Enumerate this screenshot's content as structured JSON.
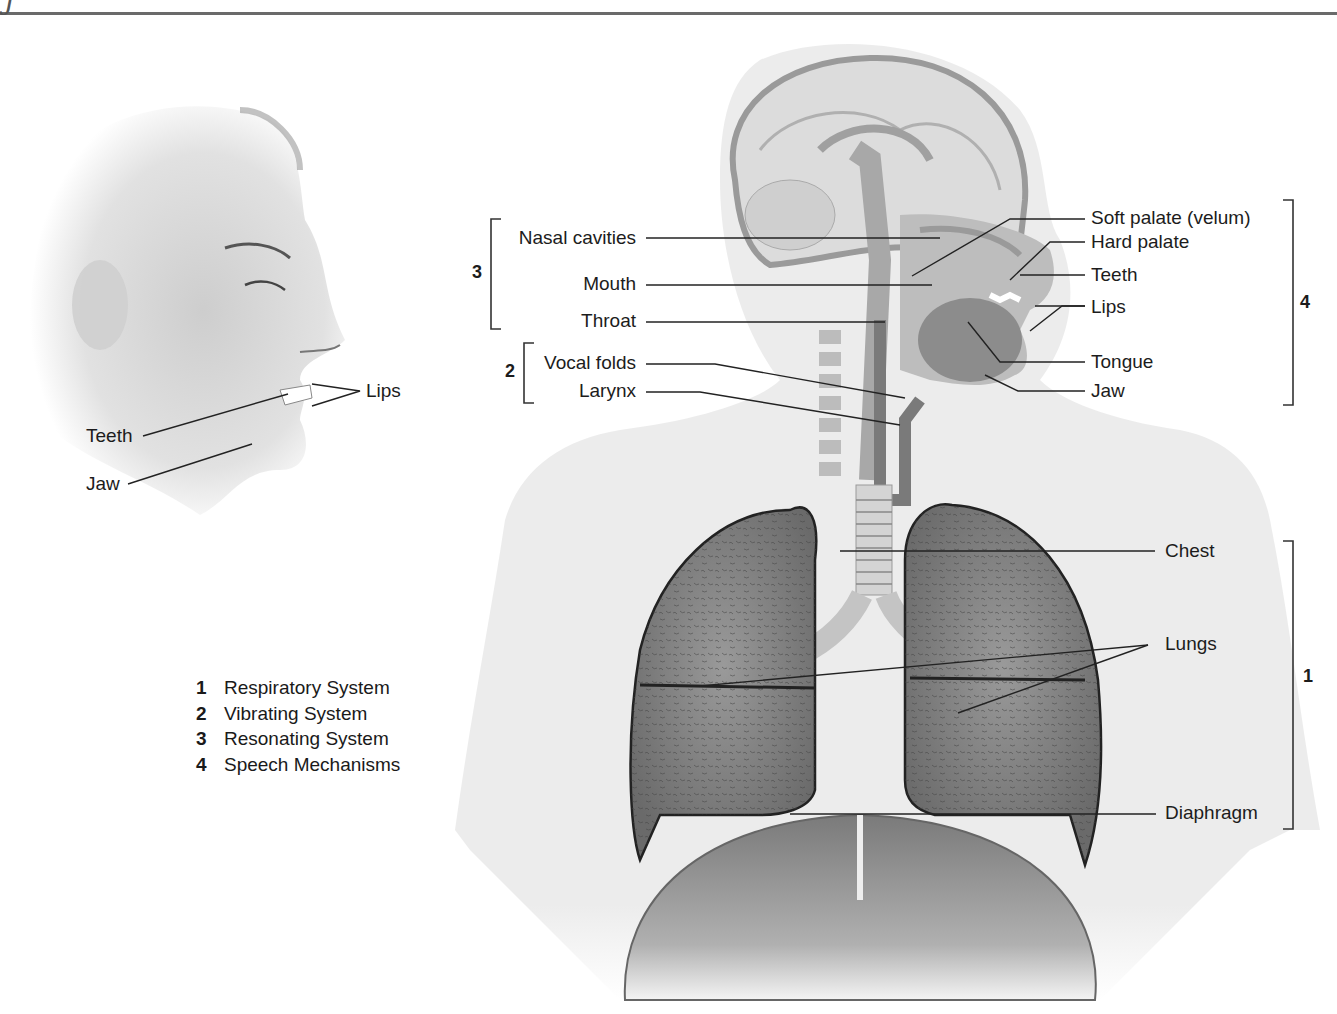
{
  "figure": {
    "corner_glyph": "J",
    "face_labels": {
      "lips": "Lips",
      "teeth": "Teeth",
      "jaw": "Jaw"
    },
    "left_group_labels": {
      "nasal_cavities": "Nasal cavities",
      "mouth": "Mouth",
      "throat": "Throat",
      "vocal_folds": "Vocal folds",
      "larynx": "Larynx"
    },
    "right_group_labels": {
      "soft_palate": "Soft palate (velum)",
      "hard_palate": "Hard palate",
      "teeth": "Teeth",
      "lips": "Lips",
      "tongue": "Tongue",
      "jaw": "Jaw"
    },
    "torso_labels": {
      "chest": "Chest",
      "lungs": "Lungs",
      "diaphragm": "Diaphragm"
    },
    "bracket_numbers": {
      "resonating": "3",
      "vibrating": "2",
      "speech": "4",
      "respiratory": "1"
    },
    "legend": [
      {
        "number": "1",
        "label": "Respiratory System"
      },
      {
        "number": "2",
        "label": "Vibrating System"
      },
      {
        "number": "3",
        "label": "Resonating System"
      },
      {
        "number": "4",
        "label": "Speech Mechanisms"
      }
    ]
  }
}
